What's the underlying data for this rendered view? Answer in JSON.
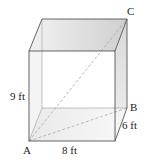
{
  "diagram": {
    "type": "rectangular-prism",
    "vertex_labels": {
      "A": "A",
      "B": "B",
      "C": "C"
    },
    "dimensions": {
      "height": "9 ft",
      "length": "8 ft",
      "width": "6 ft"
    },
    "colors": {
      "edge": "#555555",
      "hidden_edge": "#999999",
      "diagonal": "#aaaaaa",
      "top_face": "#dcdcdc",
      "side_face": "#e6e6e6"
    }
  }
}
